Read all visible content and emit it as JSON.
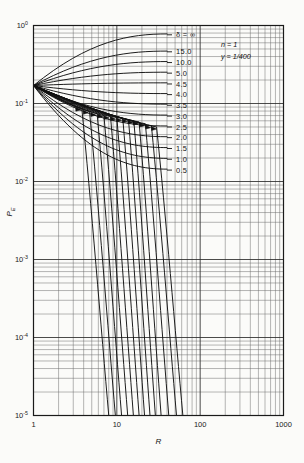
{
  "chart_data": {
    "type": "line",
    "title": "",
    "xlabel": "R",
    "ylabel": "PE",
    "xscale": "log",
    "yscale": "log",
    "xlim": [
      1,
      1000
    ],
    "ylim": [
      1e-05,
      1
    ],
    "grid": true,
    "legend_position": "inside-right",
    "x_ticks": [
      "1",
      "10",
      "100",
      "1000"
    ],
    "x_tick_values": [
      1,
      10,
      100,
      1000
    ],
    "y_ticks": [
      "10^0",
      "10^-1",
      "10^-2",
      "10^-3",
      "10^-4",
      "10^-5"
    ],
    "y_tick_mantissa": "10",
    "y_tick_exponents": [
      "0",
      "-1",
      "-2",
      "-3",
      "-4",
      "-5"
    ],
    "y_tick_values": [
      1,
      0.1,
      0.01,
      0.001,
      0.0001,
      1e-05
    ],
    "parameter_symbol": "δ",
    "annotations": [
      {
        "name": "n-value",
        "text": "n = 1"
      },
      {
        "name": "y-value",
        "text": "y = 1/400"
      }
    ],
    "convergence_point": {
      "x": 1,
      "y": 0.17
    },
    "series": [
      {
        "name": "delta-inf",
        "label": "δ = ∞",
        "delta": "inf",
        "label_y": 0.76,
        "branch_upper_end": [
          40,
          0.78
        ],
        "branch_lower_knee": [
          30,
          0.05
        ],
        "arrow_at": [
          30.0,
          0.047
        ],
        "lower_end_x": 62.0
      },
      {
        "name": "delta-15",
        "label": "15.0",
        "delta": 15.0,
        "label_y": 0.46,
        "branch_upper_end": [
          40,
          0.47
        ],
        "branch_lower_knee": [
          26,
          0.052
        ],
        "arrow_at": [
          25.5,
          0.049
        ],
        "lower_end_x": 52.0
      },
      {
        "name": "delta-10",
        "label": "10.0",
        "delta": 10.0,
        "label_y": 0.335,
        "branch_upper_end": [
          40,
          0.345
        ],
        "branch_lower_knee": [
          22,
          0.055
        ],
        "arrow_at": [
          21.5,
          0.052
        ],
        "lower_end_x": 42.0
      },
      {
        "name": "delta-5",
        "label": "5.0",
        "delta": 5.0,
        "label_y": 0.245,
        "branch_upper_end": [
          40,
          0.252
        ],
        "branch_lower_knee": [
          18.5,
          0.058
        ],
        "arrow_at": [
          18.0,
          0.055
        ],
        "lower_end_x": 34.0
      },
      {
        "name": "delta-4p5",
        "label": "4.5",
        "delta": 4.5,
        "label_y": 0.178,
        "branch_upper_end": [
          40,
          0.184
        ],
        "branch_lower_knee": [
          16.0,
          0.06
        ],
        "arrow_at": [
          15.6,
          0.057
        ],
        "lower_end_x": 29.0
      },
      {
        "name": "delta-4",
        "label": "4.0",
        "delta": 4.0,
        "label_y": 0.13,
        "branch_upper_end": [
          40,
          0.134
        ],
        "branch_lower_knee": [
          13.8,
          0.062
        ],
        "arrow_at": [
          13.4,
          0.059
        ],
        "lower_end_x": 25.0
      },
      {
        "name": "delta-3p5",
        "label": "3.5",
        "delta": 3.5,
        "label_y": 0.095,
        "branch_upper_end": [
          40,
          0.098
        ],
        "branch_lower_knee": [
          11.8,
          0.064
        ],
        "arrow_at": [
          11.4,
          0.061
        ],
        "lower_end_x": 21.5
      },
      {
        "name": "delta-3",
        "label": "3.0",
        "delta": 3.0,
        "label_y": 0.069,
        "branch_upper_end": [
          40,
          0.071
        ],
        "branch_lower_knee": [
          10.0,
          0.066
        ],
        "arrow_at": [
          9.7,
          0.063
        ],
        "lower_end_x": 18.5
      },
      {
        "name": "delta-2p5",
        "label": "2.5",
        "delta": 2.5,
        "label_y": 0.05,
        "branch_upper_end": [
          40,
          0.0515
        ],
        "branch_lower_knee": [
          8.4,
          0.068
        ],
        "arrow_at": [
          8.1,
          0.065
        ],
        "lower_end_x": 15.8
      },
      {
        "name": "delta-2",
        "label": "2.0",
        "delta": 2.0,
        "label_y": 0.0365,
        "branch_upper_end": [
          40,
          0.0375
        ],
        "branch_lower_knee": [
          7.0,
          0.07
        ],
        "arrow_at": [
          6.8,
          0.068
        ],
        "lower_end_x": 13.5
      },
      {
        "name": "delta-1p5",
        "label": "1.5",
        "delta": 1.5,
        "label_y": 0.0265,
        "branch_upper_end": [
          40,
          0.0272
        ],
        "branch_lower_knee": [
          5.8,
          0.074
        ],
        "arrow_at": [
          5.6,
          0.071
        ],
        "lower_end_x": 11.4
      },
      {
        "name": "delta-1",
        "label": "1.0",
        "delta": 1.0,
        "label_y": 0.0193,
        "branch_upper_end": [
          40,
          0.0198
        ],
        "branch_lower_knee": [
          4.7,
          0.079
        ],
        "arrow_at": [
          4.55,
          0.076
        ],
        "lower_end_x": 9.6
      },
      {
        "name": "delta-0p5",
        "label": "0.5",
        "delta": 0.5,
        "label_y": 0.014,
        "branch_upper_end": [
          40,
          0.0144
        ],
        "branch_lower_knee": [
          3.8,
          0.086
        ],
        "arrow_at": [
          3.7,
          0.083
        ],
        "lower_end_x": 8.0
      }
    ]
  },
  "axes": {
    "x_title": "R",
    "y_title": "PE",
    "y_title_main": "P",
    "y_title_sub": "E"
  }
}
